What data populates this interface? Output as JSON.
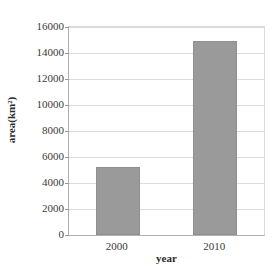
{
  "chart_data": {
    "type": "bar",
    "title": "",
    "categories": [
      "2000",
      "2010"
    ],
    "values": [
      5200,
      14900
    ],
    "series": [
      {
        "name": "area",
        "values": [
          5200,
          14900
        ]
      }
    ],
    "xlabel": "year",
    "ylabel": "area(km²)",
    "ylim": [
      0,
      16000
    ],
    "yticks": [
      0,
      2000,
      4000,
      6000,
      8000,
      10000,
      12000,
      14000,
      16000
    ],
    "ytick_labels": [
      "0",
      "2000",
      "4000",
      "6000",
      "8000",
      "10000",
      "12000",
      "14000",
      "16000"
    ],
    "grid": true,
    "grid_axis": "y",
    "legend": false,
    "legend_position": "none",
    "bar_color": "#9a9a9a",
    "bar_edge_color": "#8f8f8f",
    "gridline_color": "#dcdcdc",
    "axis_color": "#b0b0b0",
    "text_color": "#3a3a3a",
    "background": "#ffffff"
  }
}
